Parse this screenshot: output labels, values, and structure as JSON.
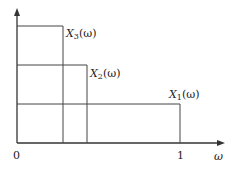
{
  "diagram": {
    "axes": {
      "x_label": "ω",
      "origin_label": "0",
      "x_tick_label": "1"
    },
    "functions": [
      {
        "name": "X",
        "sub": "1",
        "arg": "(ω)",
        "height_px": 104,
        "width_end_px": 180
      },
      {
        "name": "X",
        "sub": "2",
        "arg": "(ω)",
        "height_px": 65,
        "width_end_px": 87
      },
      {
        "name": "X",
        "sub": "3",
        "arg": "(ω)",
        "height_px": 26,
        "width_end_px": 63
      }
    ],
    "colors": {
      "line": "#333333",
      "text": "#222222"
    }
  }
}
